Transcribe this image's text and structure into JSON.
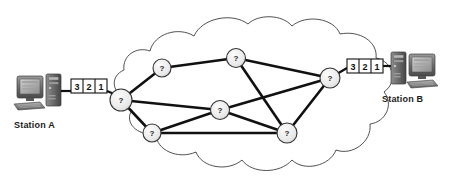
{
  "diagram": {
    "colors": {
      "background": "#ffffff",
      "line": "#111111",
      "cloud_outline": "#3a3a3a",
      "node_fill": "#e8e8e8",
      "node_stroke": "#333333",
      "packet_fill": "#ffffff",
      "packet_stroke": "#111111",
      "text": "#1a1a1a",
      "device_dark": "#4a4a4a",
      "device_mid": "#7d7d7d",
      "device_light": "#b4b4b4"
    },
    "stations": [
      {
        "id": "station-a",
        "label": "Station A",
        "side": "left",
        "device_icon": "desktop-computer-icon"
      },
      {
        "id": "station-b",
        "label": "Station B",
        "side": "right",
        "device_icon": "desktop-computer-icon"
      }
    ],
    "packet_trains": [
      {
        "id": "packets-left",
        "side": "left",
        "packets": [
          "3",
          "2",
          "1"
        ]
      },
      {
        "id": "packets-right",
        "side": "right",
        "packets": [
          "3",
          "2",
          "1"
        ]
      }
    ],
    "cloud": {
      "name": "network-cloud",
      "label": ""
    },
    "nodes": [
      {
        "id": "n-entry",
        "label": "?",
        "x": 121,
        "y": 100,
        "r": 11
      },
      {
        "id": "n-upper-left",
        "label": "?",
        "x": 162,
        "y": 68,
        "r": 9
      },
      {
        "id": "n-top",
        "label": "?",
        "x": 236,
        "y": 58,
        "r": 9.5
      },
      {
        "id": "n-center",
        "label": "?",
        "x": 220,
        "y": 110,
        "r": 9.5
      },
      {
        "id": "n-lower-left",
        "label": "?",
        "x": 152,
        "y": 133,
        "r": 9
      },
      {
        "id": "n-lower-right",
        "label": "?",
        "x": 287,
        "y": 133,
        "r": 10
      },
      {
        "id": "n-exit",
        "label": "?",
        "x": 330,
        "y": 78,
        "r": 10
      }
    ],
    "links": [
      {
        "from": "n-entry",
        "to": "n-upper-left"
      },
      {
        "from": "n-entry",
        "to": "n-center"
      },
      {
        "from": "n-entry",
        "to": "n-lower-left"
      },
      {
        "from": "n-upper-left",
        "to": "n-top"
      },
      {
        "from": "n-top",
        "to": "n-exit"
      },
      {
        "from": "n-top",
        "to": "n-lower-right"
      },
      {
        "from": "n-center",
        "to": "n-exit"
      },
      {
        "from": "n-center",
        "to": "n-lower-right"
      },
      {
        "from": "n-center",
        "to": "n-lower-left"
      },
      {
        "from": "n-lower-left",
        "to": "n-lower-right"
      },
      {
        "from": "n-lower-right",
        "to": "n-exit"
      }
    ],
    "wires": [
      {
        "id": "wire-a",
        "from": "station-a",
        "to": "n-entry"
      },
      {
        "id": "wire-b",
        "from": "n-exit",
        "to": "station-b"
      }
    ]
  }
}
